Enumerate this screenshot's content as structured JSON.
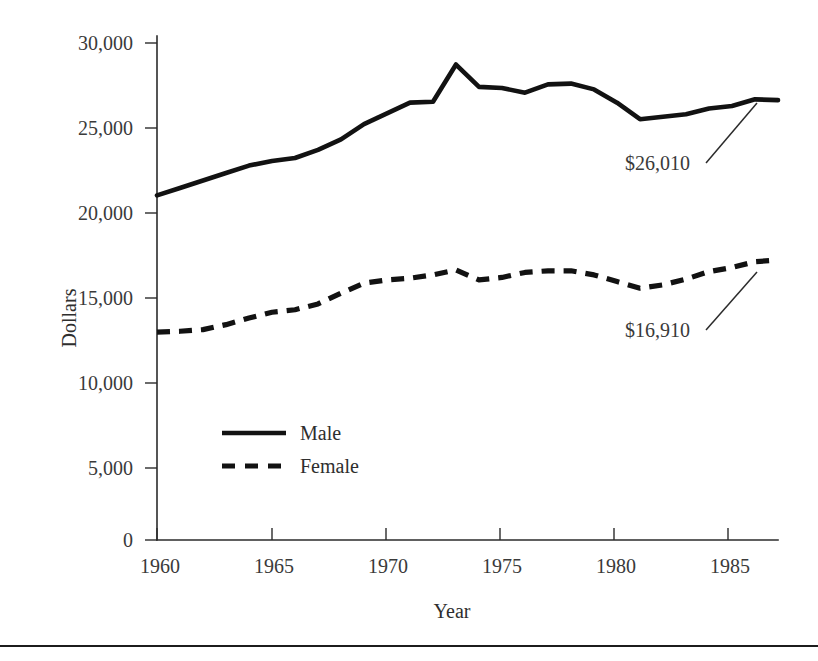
{
  "chart_data": {
    "type": "line",
    "title": "",
    "xlabel": "Year",
    "ylabel": "Dollars",
    "xlim": [
      1960,
      1987
    ],
    "ylim": [
      0,
      31500
    ],
    "grid": false,
    "legend_position": "inside-lower-left",
    "x": [
      1960,
      1961,
      1962,
      1963,
      1964,
      1965,
      1966,
      1967,
      1968,
      1969,
      1970,
      1971,
      1972,
      1973,
      1974,
      1975,
      1976,
      1977,
      1978,
      1979,
      1980,
      1981,
      1982,
      1983,
      1984,
      1985,
      1986,
      1987
    ],
    "xticks": [
      1960,
      1965,
      1970,
      1975,
      1980,
      1985
    ],
    "xticklabels": [
      "1960",
      "1965",
      "1970",
      "1975",
      "1980",
      "1985"
    ],
    "yticks": [
      0,
      5000,
      10000,
      15000,
      20000,
      25000,
      30000
    ],
    "yticklabels": [
      "0",
      "5,000",
      "10,000",
      "15,000",
      "20,000",
      "25,000",
      "30,000"
    ],
    "series": [
      {
        "name": "Male",
        "style": "solid",
        "color": "#121212",
        "values": [
          20800,
          21250,
          21700,
          22150,
          22600,
          22880,
          23060,
          23550,
          24180,
          25100,
          25750,
          26400,
          26450,
          28700,
          27350,
          27280,
          27000,
          27500,
          27550,
          27200,
          26400,
          25400,
          25550,
          25700,
          26050,
          26200,
          26600,
          26550
        ]
      },
      {
        "name": "Female",
        "style": "dashed",
        "color": "#121212",
        "values": [
          12550,
          12600,
          12700,
          13000,
          13400,
          13750,
          13900,
          14250,
          14900,
          15500,
          15700,
          15800,
          16000,
          16300,
          15700,
          15850,
          16150,
          16250,
          16250,
          16000,
          15600,
          15200,
          15400,
          15750,
          16200,
          16450,
          16800,
          16900
        ]
      }
    ],
    "annotations": [
      {
        "text": "$26,010",
        "series": "Male",
        "value": 26010,
        "x": 1987
      },
      {
        "text": "$16,910",
        "series": "Female",
        "value": 16910,
        "x": 1987
      }
    ],
    "legend": [
      {
        "label": "Male",
        "style": "solid"
      },
      {
        "label": "Female",
        "style": "dashed"
      }
    ]
  }
}
